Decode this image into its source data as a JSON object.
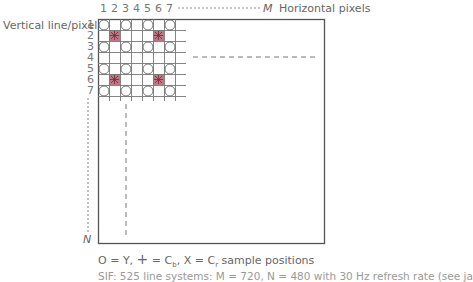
{
  "diagram": {
    "column_numbers": [
      "1",
      "2",
      "3",
      "4",
      "5",
      "6",
      "7"
    ],
    "row_numbers": [
      "1",
      "2",
      "3",
      "4",
      "5",
      "6",
      "7"
    ],
    "top_axis_end": "M",
    "top_axis_label": "Horizontal pixels",
    "left_axis_label": "Vertical line/pixel",
    "left_axis_end": "N",
    "legend": {
      "y_symbol": "O",
      "y_text": "= Y,",
      "cb_symbol": "+",
      "cb_text": "= C",
      "cb_sub": "b",
      "cr_symbol": ", X",
      "cr_text": "= C",
      "cr_sub": "r",
      "tail": "sample positions"
    },
    "caption": "SIF: 525 line systems: M = 720, N = 480 with 30 Hz refresh rate (see ja",
    "grid": {
      "cols": 7,
      "rows": 7,
      "luma_columns": [
        1,
        3,
        5,
        7
      ],
      "luma_rows": [
        1,
        2,
        3,
        5,
        6,
        7
      ],
      "chroma_positions": [
        [
          2,
          2
        ],
        [
          6,
          2
        ],
        [
          2,
          6
        ],
        [
          6,
          6
        ]
      ]
    },
    "colors": {
      "frame": "#555555",
      "grid": "#777777",
      "chroma_fill": "#b0606f",
      "text": "#666666"
    }
  }
}
